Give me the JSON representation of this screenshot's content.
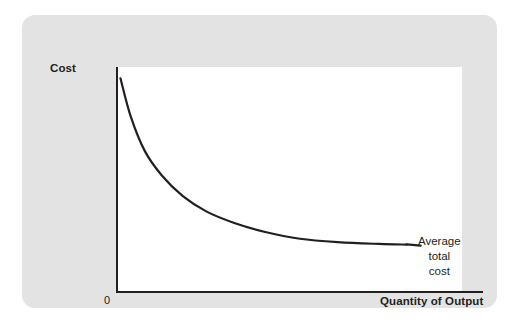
{
  "figure": {
    "background_color": "#ffffff",
    "panel_color": "#e3e3e3",
    "plot_color": "#ffffff",
    "ink_color": "#231f20"
  },
  "axes": {
    "y_title": "Cost",
    "x_title": "Quantity of Output",
    "origin_label": "0"
  },
  "annotation": {
    "line1": "Average",
    "line2": "total",
    "line3": "cost"
  },
  "chart_data": {
    "type": "line",
    "title": "",
    "subtitle": "",
    "xlabel": "Quantity of Output",
    "ylabel": "Cost",
    "grid": false,
    "legend_position": "inline-right-annotation",
    "xlim": [
      0,
      100
    ],
    "ylim": [
      0,
      100
    ],
    "xticks": [],
    "yticks": [],
    "xticklabels": [],
    "yticklabels": [],
    "annotations": [
      {
        "text": "Average total cost",
        "x": 88,
        "y": 21,
        "leader_from_x": 84,
        "leader_from_y": 21.5
      },
      {
        "text": "0",
        "x": 0,
        "y": 0
      }
    ],
    "series": [
      {
        "name": "Average total cost",
        "color": "#231f20",
        "linewidth": 2.2,
        "x": [
          1,
          4,
          8,
          13,
          19,
          26,
          34,
          43,
          53,
          64,
          76,
          84
        ],
        "y": [
          95,
          78,
          63,
          52,
          43,
          36,
          31,
          27,
          24,
          22.5,
          21.7,
          21.4
        ]
      }
    ]
  }
}
